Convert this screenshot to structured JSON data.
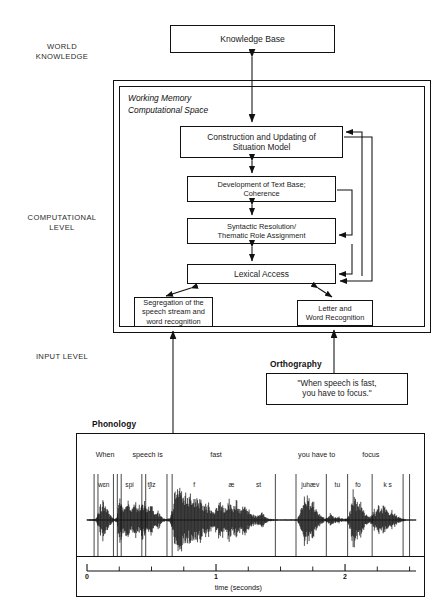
{
  "diagram": {
    "level_labels": [
      {
        "id": "world-knowledge",
        "text": "WORLD\nKNOWLEDGE",
        "line1": "WORLD",
        "line2": "KNOWLEDGE"
      },
      {
        "id": "computational-level",
        "text": "COMPUTATIONAL\nLEVEL",
        "line1": "COMPUTATIONAL",
        "line2": "LEVEL"
      },
      {
        "id": "input-level",
        "text": "INPUT LEVEL",
        "line1": "INPUT LEVEL",
        "line2": ""
      }
    ],
    "working_memory_label": {
      "line1": "Working Memory",
      "line2": "Computational Space"
    },
    "boxes": {
      "knowledge_base": {
        "line1": "Knowledge Base",
        "line2": ""
      },
      "construction": {
        "line1": "Construction and Updating of",
        "line2": "Situation Model"
      },
      "text_base": {
        "line1": "Development of Text Base;",
        "line2": "Coherence"
      },
      "syntactic": {
        "line1": "Syntactic Resolution/",
        "line2": "Thematic Role Assignment"
      },
      "lexical": {
        "line1": "Lexical Access",
        "line2": ""
      },
      "segregation": {
        "line1": "Segregation of the",
        "line2": "speech stream and",
        "line3": "word recognition"
      },
      "letter": {
        "line1": "Letter and",
        "line2": "Word Recognition",
        "line3": ""
      },
      "orthography_text": {
        "line1": "\"When speech is fast,",
        "line2": "you have to focus.\""
      }
    },
    "captions": {
      "orthography": "Orthography",
      "phonology": "Phonology"
    }
  },
  "chart_data": {
    "type": "line",
    "title": "Phonology",
    "xlabel": "time (seconds)",
    "ylabel": "",
    "xlim": [
      0,
      2.55
    ],
    "xticks_major": [
      0,
      1,
      2
    ],
    "xtick_labels": [
      "0",
      "1",
      "2"
    ],
    "xticks_minor": [
      0.25,
      0.5,
      0.75,
      1.25,
      1.5,
      1.75,
      2.25,
      2.5
    ],
    "grid": false,
    "legend": "none",
    "annotations": {
      "words": [
        {
          "label": "When",
          "t": 0.14
        },
        {
          "label": "speech is",
          "t": 0.47
        },
        {
          "label": "fast",
          "t": 1.0
        },
        {
          "label": "you have to",
          "t": 1.78
        },
        {
          "label": "focus",
          "t": 2.2
        }
      ],
      "phones": [
        {
          "label": "wɛn",
          "t": 0.13
        },
        {
          "label": "spi",
          "t": 0.33
        },
        {
          "label": "tʃiz",
          "t": 0.5
        },
        {
          "label": "f",
          "t": 0.83
        },
        {
          "label": "æ",
          "t": 1.12
        },
        {
          "label": "st",
          "t": 1.33
        },
        {
          "label": "juhæv",
          "t": 1.73
        },
        {
          "label": "tu",
          "t": 1.94
        },
        {
          "label": "fo",
          "t": 2.1
        },
        {
          "label": "k s",
          "t": 2.33
        }
      ],
      "segment_boundaries": [
        0.055,
        0.085,
        0.205,
        0.235,
        0.265,
        0.425,
        0.455,
        0.62,
        0.66,
        1.46,
        1.62,
        1.855,
        2.02,
        2.21,
        2.45,
        2.5
      ]
    },
    "waveform": {
      "baseline_description": "Amplitude envelope of the spoken sentence \"When speech is fast, you have to focus.\"",
      "envelope": [
        [
          0.0,
          0.02
        ],
        [
          0.04,
          0.03
        ],
        [
          0.07,
          0.05
        ],
        [
          0.09,
          0.22
        ],
        [
          0.105,
          0.45
        ],
        [
          0.12,
          0.6
        ],
        [
          0.135,
          0.52
        ],
        [
          0.15,
          0.4
        ],
        [
          0.165,
          0.3
        ],
        [
          0.18,
          0.18
        ],
        [
          0.2,
          0.07
        ],
        [
          0.215,
          0.05
        ],
        [
          0.23,
          0.1
        ],
        [
          0.245,
          0.55
        ],
        [
          0.26,
          0.72
        ],
        [
          0.275,
          0.5
        ],
        [
          0.29,
          0.38
        ],
        [
          0.305,
          0.46
        ],
        [
          0.32,
          0.6
        ],
        [
          0.335,
          0.42
        ],
        [
          0.35,
          0.3
        ],
        [
          0.365,
          0.48
        ],
        [
          0.38,
          0.62
        ],
        [
          0.395,
          0.44
        ],
        [
          0.41,
          0.33
        ],
        [
          0.425,
          0.5
        ],
        [
          0.44,
          0.66
        ],
        [
          0.455,
          0.46
        ],
        [
          0.47,
          0.34
        ],
        [
          0.485,
          0.42
        ],
        [
          0.5,
          0.55
        ],
        [
          0.515,
          0.38
        ],
        [
          0.53,
          0.26
        ],
        [
          0.545,
          0.3
        ],
        [
          0.56,
          0.22
        ],
        [
          0.58,
          0.12
        ],
        [
          0.6,
          0.06
        ],
        [
          0.62,
          0.04
        ],
        [
          0.64,
          0.05
        ],
        [
          0.66,
          0.3
        ],
        [
          0.675,
          0.72
        ],
        [
          0.69,
          0.95
        ],
        [
          0.705,
          1.0
        ],
        [
          0.72,
          0.86
        ],
        [
          0.735,
          0.95
        ],
        [
          0.75,
          0.78
        ],
        [
          0.765,
          0.9
        ],
        [
          0.78,
          0.7
        ],
        [
          0.795,
          0.82
        ],
        [
          0.81,
          0.65
        ],
        [
          0.825,
          0.76
        ],
        [
          0.84,
          0.6
        ],
        [
          0.855,
          0.7
        ],
        [
          0.87,
          0.55
        ],
        [
          0.885,
          0.64
        ],
        [
          0.9,
          0.48
        ],
        [
          0.915,
          0.56
        ],
        [
          0.93,
          0.42
        ],
        [
          0.945,
          0.5
        ],
        [
          0.96,
          0.36
        ],
        [
          0.98,
          0.28
        ],
        [
          1.0,
          0.34
        ],
        [
          1.02,
          0.48
        ],
        [
          1.04,
          0.62
        ],
        [
          1.055,
          0.5
        ],
        [
          1.07,
          0.4
        ],
        [
          1.085,
          0.52
        ],
        [
          1.1,
          0.66
        ],
        [
          1.115,
          0.48
        ],
        [
          1.13,
          0.38
        ],
        [
          1.145,
          0.5
        ],
        [
          1.16,
          0.62
        ],
        [
          1.175,
          0.44
        ],
        [
          1.19,
          0.34
        ],
        [
          1.205,
          0.46
        ],
        [
          1.22,
          0.56
        ],
        [
          1.235,
          0.4
        ],
        [
          1.25,
          0.3
        ],
        [
          1.27,
          0.22
        ],
        [
          1.29,
          0.16
        ],
        [
          1.31,
          0.12
        ],
        [
          1.33,
          0.18
        ],
        [
          1.35,
          0.26
        ],
        [
          1.365,
          0.2
        ],
        [
          1.38,
          0.12
        ],
        [
          1.4,
          0.07
        ],
        [
          1.43,
          0.04
        ],
        [
          1.46,
          0.02
        ],
        [
          1.5,
          0.02
        ],
        [
          1.55,
          0.02
        ],
        [
          1.6,
          0.02
        ],
        [
          1.63,
          0.03
        ],
        [
          1.655,
          0.25
        ],
        [
          1.67,
          0.62
        ],
        [
          1.685,
          0.8
        ],
        [
          1.7,
          0.68
        ],
        [
          1.715,
          0.78
        ],
        [
          1.73,
          0.6
        ],
        [
          1.745,
          0.7
        ],
        [
          1.76,
          0.5
        ],
        [
          1.775,
          0.4
        ],
        [
          1.79,
          0.26
        ],
        [
          1.81,
          0.14
        ],
        [
          1.83,
          0.08
        ],
        [
          1.85,
          0.06
        ],
        [
          1.87,
          0.1
        ],
        [
          1.885,
          0.22
        ],
        [
          1.9,
          0.14
        ],
        [
          1.92,
          0.08
        ],
        [
          1.94,
          0.12
        ],
        [
          1.96,
          0.08
        ],
        [
          1.98,
          0.05
        ],
        [
          2.0,
          0.04
        ],
        [
          2.02,
          0.06
        ],
        [
          2.04,
          0.3
        ],
        [
          2.055,
          0.66
        ],
        [
          2.07,
          0.8
        ],
        [
          2.085,
          0.66
        ],
        [
          2.1,
          0.74
        ],
        [
          2.115,
          0.54
        ],
        [
          2.13,
          0.4
        ],
        [
          2.15,
          0.22
        ],
        [
          2.17,
          0.12
        ],
        [
          2.19,
          0.1
        ],
        [
          2.21,
          0.18
        ],
        [
          2.225,
          0.34
        ],
        [
          2.24,
          0.26
        ],
        [
          2.255,
          0.38
        ],
        [
          2.27,
          0.46
        ],
        [
          2.285,
          0.34
        ],
        [
          2.3,
          0.44
        ],
        [
          2.315,
          0.3
        ],
        [
          2.33,
          0.38
        ],
        [
          2.345,
          0.28
        ],
        [
          2.36,
          0.34
        ],
        [
          2.375,
          0.24
        ],
        [
          2.39,
          0.18
        ],
        [
          2.41,
          0.12
        ],
        [
          2.43,
          0.07
        ],
        [
          2.45,
          0.04
        ],
        [
          2.48,
          0.02
        ],
        [
          2.52,
          0.01
        ],
        [
          2.55,
          0.01
        ]
      ]
    }
  }
}
